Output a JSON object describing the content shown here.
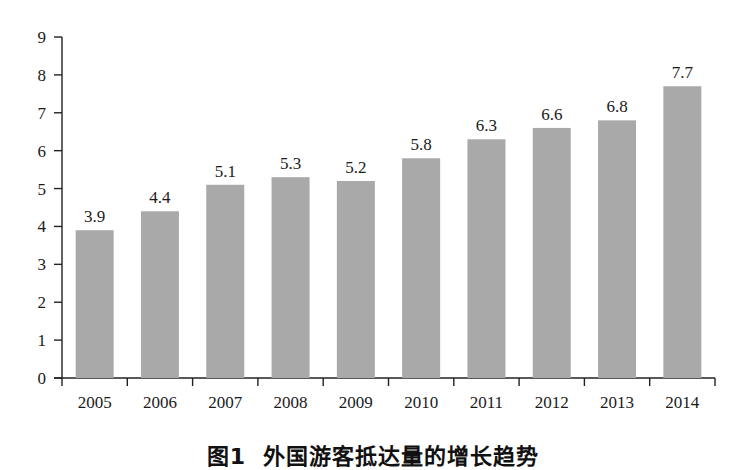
{
  "chart_data": {
    "type": "bar",
    "xlabel": "",
    "ylabel": "",
    "categories": [
      "2005",
      "2006",
      "2007",
      "2008",
      "2009",
      "2010",
      "2011",
      "2012",
      "2013",
      "2014"
    ],
    "values": [
      3.9,
      4.4,
      5.1,
      5.3,
      5.2,
      5.8,
      6.3,
      6.6,
      6.8,
      7.7
    ],
    "value_labels": [
      "3.9",
      "4.4",
      "5.1",
      "5.3",
      "5.2",
      "5.8",
      "6.3",
      "6.6",
      "6.8",
      "7.7"
    ],
    "ylim": [
      0,
      9
    ],
    "yticks": [
      0,
      1,
      2,
      3,
      4,
      5,
      6,
      7,
      8,
      9
    ],
    "grid": false,
    "legend": null,
    "bar_color": "#a9a9a9"
  },
  "caption": {
    "figure_number": "图1",
    "text": "外国游客抵达量的增长趋势"
  }
}
